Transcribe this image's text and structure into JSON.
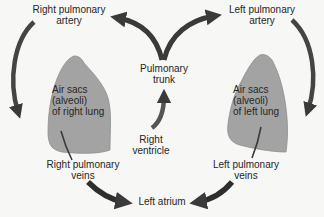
{
  "diagram": {
    "colors": {
      "background": "#f7f7f5",
      "lung_fill": "#a3a3a3",
      "lung_stroke": "#8a8a8a",
      "arrow": "#3a3a3a",
      "text": "#262626"
    },
    "nodes": {
      "right_pulmonary_artery": "Right pulmonary\nartery",
      "left_pulmonary_artery": "Left pulmonary\nartery",
      "pulmonary_trunk": "Pulmonary\ntrunk",
      "right_ventricle": "Right\nventricle",
      "right_lung": "Air sacs\n(alveoli)\nof right lung",
      "left_lung": "Air sacs\n(alveoli)\nof left lung",
      "right_pulmonary_veins": "Right pulmonary\nveins",
      "left_pulmonary_veins": "Left pulmonary\nveins",
      "left_atrium": "Left atrium"
    },
    "flow": [
      {
        "from": "Right ventricle",
        "to": "Pulmonary trunk"
      },
      {
        "from": "Pulmonary trunk",
        "to": "Right pulmonary artery"
      },
      {
        "from": "Pulmonary trunk",
        "to": "Left pulmonary artery"
      },
      {
        "from": "Right pulmonary artery",
        "to": "Air sacs (alveoli) of right lung"
      },
      {
        "from": "Left pulmonary artery",
        "to": "Air sacs (alveoli) of left lung"
      },
      {
        "from": "Air sacs (alveoli) of right lung",
        "to": "Right pulmonary veins"
      },
      {
        "from": "Air sacs (alveoli) of left lung",
        "to": "Left pulmonary veins"
      },
      {
        "from": "Right pulmonary veins",
        "to": "Left atrium"
      },
      {
        "from": "Left pulmonary veins",
        "to": "Left atrium"
      }
    ]
  }
}
